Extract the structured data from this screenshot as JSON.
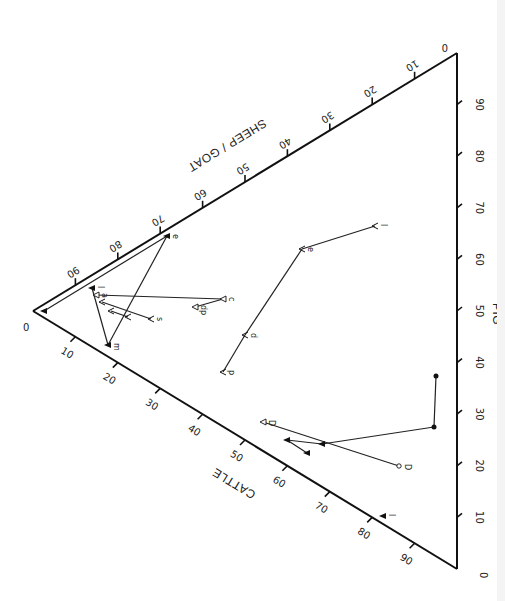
{
  "chart_data": {
    "type": "ternary-scatter",
    "title": "",
    "orientation": "rotated ternary diagram (vertices: left = Sheep/Goat 100%, top-right = Pig 100%, bottom-right = Cattle 100%)",
    "axes": {
      "sheep_goat": {
        "label": "SHEEP / GOAT",
        "edge": "top (left apex to top-right apex)",
        "ticks": [
          90,
          80,
          70,
          60,
          50,
          40,
          30,
          20,
          10
        ],
        "end_label": "0"
      },
      "cattle": {
        "label": "CATTLE",
        "edge": "bottom (left apex to bottom-right apex)",
        "ticks": [
          10,
          20,
          30,
          40,
          50,
          60,
          70,
          80,
          90
        ],
        "start_label": "0"
      },
      "pig": {
        "label": "PIG",
        "edge": "right (bottom-right apex to top-right apex)",
        "ticks": [
          10,
          20,
          30,
          40,
          50,
          60,
          70,
          80,
          90
        ],
        "start_label": "0"
      }
    },
    "grid": false,
    "legend": null,
    "points": [
      {
        "id": "a0",
        "marker": "filled-triangle",
        "label": "",
        "x": 44,
        "y": 311
      },
      {
        "id": "e1",
        "marker": "filled-triangle",
        "label": "e",
        "x": 167,
        "y": 236
      },
      {
        "id": "l1",
        "marker": "filled-triangle",
        "label": "l",
        "x": 92,
        "y": 288
      },
      {
        "id": "a1",
        "marker": "open-triangle",
        "label": "a",
        "x": 96,
        "y": 295
      },
      {
        "id": "m1",
        "marker": "filled-triangle",
        "label": "m",
        "x": 108,
        "y": 345
      },
      {
        "id": "v1",
        "marker": "open-v",
        "label": "",
        "x": 102,
        "y": 302
      },
      {
        "id": "v2",
        "marker": "open-v",
        "label": "",
        "x": 111,
        "y": 311
      },
      {
        "id": "v3",
        "marker": "open-v",
        "label": "",
        "x": 128,
        "y": 317
      },
      {
        "id": "s1",
        "marker": "open-v",
        "label": "s",
        "x": 151,
        "y": 319
      },
      {
        "id": "c1",
        "marker": "open-triangle",
        "label": "c",
        "x": 223,
        "y": 299
      },
      {
        "id": "dp1",
        "marker": "open-triangle",
        "label": "dp",
        "x": 195,
        "y": 307
      },
      {
        "id": "Vp",
        "marker": "open-v",
        "label": "p",
        "x": 223,
        "y": 372
      },
      {
        "id": "Vd",
        "marker": "open-v",
        "label": "d",
        "x": 245,
        "y": 335
      },
      {
        "id": "Ve",
        "marker": "open-v",
        "label": "e",
        "x": 302,
        "y": 249
      },
      {
        "id": "Vl",
        "marker": "open-v",
        "label": "l",
        "x": 375,
        "y": 226
      },
      {
        "id": "D1",
        "marker": "open-triangle",
        "label": "D",
        "x": 263,
        "y": 422
      },
      {
        "id": "D2",
        "marker": "open-circle",
        "label": "D",
        "x": 399,
        "y": 466
      },
      {
        "id": "f1",
        "marker": "filled-triangle",
        "label": "",
        "x": 287,
        "y": 440
      },
      {
        "id": "f2",
        "marker": "filled-triangle",
        "label": "",
        "x": 322,
        "y": 444
      },
      {
        "id": "f3",
        "marker": "filled-triangle",
        "label": "",
        "x": 307,
        "y": 453
      },
      {
        "id": "b1",
        "marker": "filled-circle",
        "label": "",
        "x": 434,
        "y": 427
      },
      {
        "id": "b2",
        "marker": "filled-circle",
        "label": "",
        "x": 436,
        "y": 376
      },
      {
        "id": "T1",
        "marker": "filled-triangle",
        "label": "l",
        "x": 383,
        "y": 516
      }
    ],
    "connections": [
      [
        "a0",
        "e1"
      ],
      [
        "e1",
        "m1"
      ],
      [
        "m1",
        "l1"
      ],
      [
        "a1",
        "c1"
      ],
      [
        "c1",
        "dp1"
      ],
      [
        "v1",
        "s1"
      ],
      [
        "v2",
        "v3"
      ],
      [
        "Vp",
        "Vd"
      ],
      [
        "Vd",
        "Ve"
      ],
      [
        "Ve",
        "Vl"
      ],
      [
        "D1",
        "D2"
      ],
      [
        "f1",
        "f2"
      ],
      [
        "f1",
        "f3"
      ],
      [
        "f2",
        "b1"
      ],
      [
        "b1",
        "b2"
      ]
    ]
  },
  "labels": {
    "sheep_goat": "SHEEP / GOAT",
    "cattle": "CATTLE",
    "pig": "PIG",
    "apex_left": "0",
    "apex_top": "0",
    "apex_bottom": "0"
  }
}
